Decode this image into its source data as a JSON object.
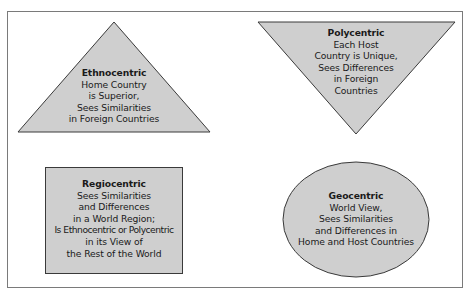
{
  "diagram": {
    "colors": {
      "fill": "#cfcfcf",
      "stroke": "#3a3a3a",
      "frame": "#7a7a7a",
      "text": "#1a1a1a"
    },
    "shapes": [
      {
        "id": "ethnocentric",
        "shape": "triangle-up",
        "title": "Ethnocentric",
        "lines": [
          "Home Country",
          "is Superior,",
          "Sees Similarities",
          "in Foreign Countries"
        ]
      },
      {
        "id": "polycentric",
        "shape": "triangle-down",
        "title": "Polycentric",
        "lines": [
          "Each Host",
          "Country is Unique,",
          "Sees Differences",
          "in Foreign",
          "Countries"
        ]
      },
      {
        "id": "regiocentric",
        "shape": "rectangle",
        "title": "Regiocentric",
        "lines": [
          "Sees Similarities",
          "and Differences",
          "in a World Region;",
          "Is Ethnocentric or Polycentric",
          "in its View of",
          "the Rest of the World"
        ]
      },
      {
        "id": "geocentric",
        "shape": "ellipse",
        "title": "Geocentric",
        "lines": [
          "World View,",
          "Sees Similarities",
          "and Differences in",
          "Home and Host Countries"
        ]
      }
    ]
  }
}
